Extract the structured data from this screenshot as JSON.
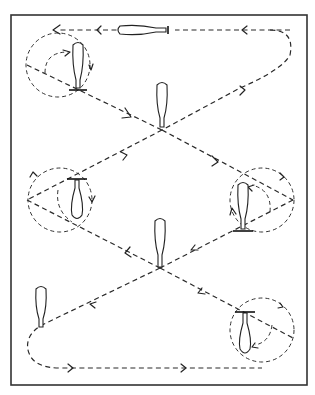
{
  "diagram": {
    "type": "skating-pattern",
    "frame": {
      "x": 11,
      "y": 15,
      "width": 296,
      "height": 370,
      "color": "#333333"
    },
    "path_color": "#2a2a2a",
    "skates": [
      {
        "id": "top-horizontal",
        "x": 148,
        "y": 30,
        "orientation": "horizontal"
      },
      {
        "id": "top-left-circle",
        "x": 78,
        "y": 68,
        "orientation": "vertical"
      },
      {
        "id": "upper-center",
        "x": 162,
        "y": 110,
        "orientation": "vertical"
      },
      {
        "id": "mid-left-circle",
        "x": 75,
        "y": 200,
        "orientation": "vertical-inverted"
      },
      {
        "id": "mid-right-circle",
        "x": 243,
        "y": 210,
        "orientation": "vertical"
      },
      {
        "id": "lower-center",
        "x": 160,
        "y": 240,
        "orientation": "vertical"
      },
      {
        "id": "lower-left",
        "x": 41,
        "y": 305,
        "orientation": "vertical"
      },
      {
        "id": "bottom-right-circle",
        "x": 245,
        "y": 335,
        "orientation": "vertical-inverted"
      }
    ],
    "turn_circles": [
      {
        "id": "top-left",
        "cx": 58,
        "cy": 65,
        "r": 32
      },
      {
        "id": "mid-left",
        "cx": 60,
        "cy": 200,
        "r": 32
      },
      {
        "id": "mid-right",
        "cx": 262,
        "cy": 200,
        "r": 32
      },
      {
        "id": "bottom-right",
        "cx": 262,
        "cy": 330,
        "r": 32
      }
    ]
  }
}
